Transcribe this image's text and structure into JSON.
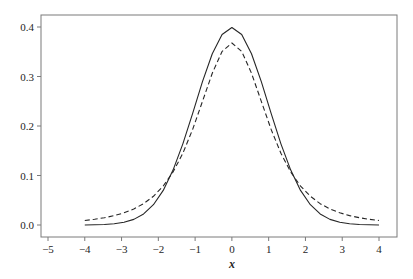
{
  "chart_data": {
    "type": "line",
    "title": "",
    "xlabel": "x",
    "ylabel": "",
    "xlim": [
      -5.2,
      4.45
    ],
    "ylim": [
      -0.02,
      0.42
    ],
    "xticks": [
      -5,
      -4,
      -3,
      -2,
      -1,
      0,
      1,
      2,
      3,
      4
    ],
    "xtick_labels": [
      "−5",
      "−4",
      "−3",
      "−2",
      "−1",
      "0",
      "1",
      "2",
      "3",
      "4"
    ],
    "yticks": [
      0.0,
      0.1,
      0.2,
      0.3,
      0.4
    ],
    "ytick_labels": [
      "0.0",
      "0.1",
      "0.2",
      "0.3",
      "0.4"
    ],
    "grid": false,
    "legend": null,
    "x": [
      -4.0,
      -3.7333,
      -3.4667,
      -3.2,
      -2.9333,
      -2.6667,
      -2.4,
      -2.1333,
      -1.8667,
      -1.6,
      -1.3333,
      -1.0667,
      -0.8,
      -0.5333,
      -0.2667,
      0.0,
      0.2667,
      0.5333,
      0.8,
      1.0667,
      1.3333,
      1.6,
      1.8667,
      2.1333,
      2.4,
      2.6667,
      2.9333,
      3.2,
      3.4667,
      3.7333,
      4.0
    ],
    "series": [
      {
        "name": "standard normal pdf",
        "style": "solid",
        "color": "#262626",
        "values": [
          0.0001,
          0.0004,
          0.001,
          0.0024,
          0.0054,
          0.0114,
          0.0224,
          0.041,
          0.0699,
          0.1109,
          0.164,
          0.2256,
          0.2897,
          0.3459,
          0.3849,
          0.3989,
          0.3849,
          0.3459,
          0.2897,
          0.2256,
          0.164,
          0.1109,
          0.0699,
          0.041,
          0.0224,
          0.0114,
          0.0054,
          0.0024,
          0.001,
          0.0004,
          0.0001
        ]
      },
      {
        "name": "Student t pdf (3 df)",
        "style": "dashed",
        "color": "#262626",
        "values": [
          0.0092,
          0.0115,
          0.0147,
          0.0189,
          0.0246,
          0.0324,
          0.0431,
          0.058,
          0.0787,
          0.107,
          0.1449,
          0.1932,
          0.2497,
          0.3066,
          0.3507,
          0.3676,
          0.3507,
          0.3066,
          0.2497,
          0.1932,
          0.1449,
          0.107,
          0.0787,
          0.058,
          0.0431,
          0.0324,
          0.0246,
          0.0189,
          0.0147,
          0.0115,
          0.0092
        ]
      }
    ]
  }
}
